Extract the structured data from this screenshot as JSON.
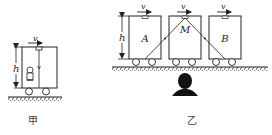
{
  "figures": [
    {
      "id": "jia",
      "caption": "甲",
      "velocity_label": "v",
      "height_label": "h",
      "description": "Single cart of height h moving right with velocity v; a light pulse travels vertically from top mirror to the observer inside"
    },
    {
      "id": "yi",
      "caption": "乙",
      "velocity_labels": [
        "v",
        "v",
        "v"
      ],
      "height_label": "h",
      "box_labels": [
        "A",
        "M",
        "B"
      ],
      "description": "Three carts moving right with velocity v; light path from A up to mirror M then down to B, observed by a person on the ground"
    }
  ],
  "colors": {
    "stroke": "#222222",
    "background": "#ffffff",
    "observer": "#111111"
  }
}
